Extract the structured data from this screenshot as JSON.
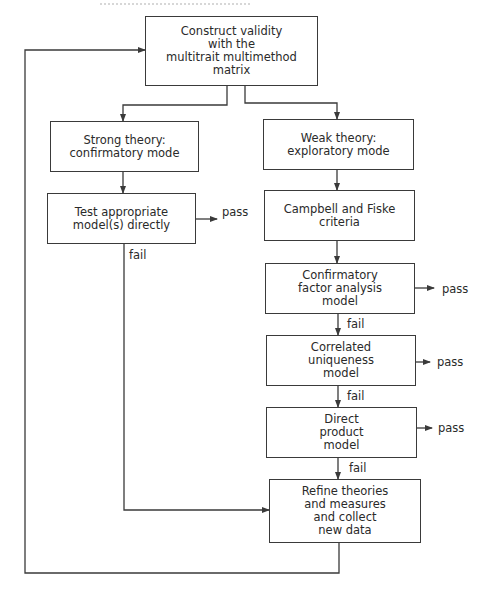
{
  "header": {
    "cutoff_text_visible": false
  },
  "colors": {
    "line": "#3a3a3a",
    "text": "#2a2a2a",
    "background": "#ffffff"
  },
  "nodes": [
    {
      "id": "construct",
      "x": 145,
      "y": 16,
      "w": 173,
      "h": 70,
      "lines": [
        "Construct validity",
        "with the",
        "multitrait multimethod",
        "matrix"
      ]
    },
    {
      "id": "strong",
      "x": 50,
      "y": 121,
      "w": 149,
      "h": 51,
      "lines": [
        "Strong theory:",
        "confirmatory mode"
      ]
    },
    {
      "id": "test",
      "x": 47,
      "y": 193,
      "w": 149,
      "h": 51,
      "lines": [
        "Test appropriate",
        "model(s) directly"
      ]
    },
    {
      "id": "weak",
      "x": 263,
      "y": 119,
      "w": 151,
      "h": 51,
      "lines": [
        "Weak theory:",
        "exploratory mode"
      ]
    },
    {
      "id": "campbell",
      "x": 264,
      "y": 190,
      "w": 151,
      "h": 51,
      "lines": [
        "Campbell and Fiske",
        "criteria"
      ]
    },
    {
      "id": "cfa",
      "x": 265,
      "y": 263,
      "w": 150,
      "h": 51,
      "lines": [
        "Confirmatory",
        "factor analysis",
        "model"
      ]
    },
    {
      "id": "correlated",
      "x": 266,
      "y": 335,
      "w": 150,
      "h": 51,
      "lines": [
        "Correlated",
        "uniqueness",
        "model"
      ]
    },
    {
      "id": "direct",
      "x": 266,
      "y": 407,
      "w": 151,
      "h": 51,
      "lines": [
        "Direct",
        "product",
        "model"
      ]
    },
    {
      "id": "refine",
      "x": 269,
      "y": 479,
      "w": 152,
      "h": 64,
      "lines": [
        "Refine theories",
        "and measures",
        "and collect",
        "new data"
      ]
    }
  ],
  "labels": [
    {
      "id": "pass-test",
      "text": "pass",
      "x": 222,
      "y": 206
    },
    {
      "id": "fail-test",
      "text": "fail",
      "x": 129,
      "y": 249
    },
    {
      "id": "pass-cfa",
      "text": "pass",
      "x": 442,
      "y": 283
    },
    {
      "id": "fail-cfa",
      "text": "fail",
      "x": 347,
      "y": 318
    },
    {
      "id": "pass-correlated",
      "text": "pass",
      "x": 437,
      "y": 356
    },
    {
      "id": "fail-correlated",
      "text": "fail",
      "x": 347,
      "y": 390
    },
    {
      "id": "pass-direct",
      "text": "pass",
      "x": 438,
      "y": 422
    },
    {
      "id": "fail-direct",
      "text": "fail",
      "x": 349,
      "y": 462
    }
  ],
  "edges": [
    {
      "id": "construct-to-strong",
      "points": [
        [
          227,
          86
        ],
        [
          227,
          105
        ],
        [
          123,
          105
        ],
        [
          123,
          121
        ]
      ],
      "arrow": true
    },
    {
      "id": "construct-to-weak",
      "points": [
        [
          245,
          86
        ],
        [
          245,
          103
        ],
        [
          337,
          103
        ],
        [
          337,
          119
        ]
      ],
      "arrow": true
    },
    {
      "id": "strong-to-test",
      "points": [
        [
          123,
          172
        ],
        [
          123,
          193
        ]
      ],
      "arrow": true
    },
    {
      "id": "test-pass",
      "points": [
        [
          196,
          219
        ],
        [
          217,
          219
        ]
      ],
      "arrow": true
    },
    {
      "id": "test-fail-to-refine",
      "points": [
        [
          124,
          244
        ],
        [
          124,
          510
        ],
        [
          269,
          510
        ]
      ],
      "arrow": true
    },
    {
      "id": "weak-to-campbell",
      "points": [
        [
          337,
          170
        ],
        [
          337,
          190
        ]
      ],
      "arrow": true
    },
    {
      "id": "campbell-to-cfa",
      "points": [
        [
          337,
          241
        ],
        [
          337,
          263
        ]
      ],
      "arrow": true
    },
    {
      "id": "cfa-pass",
      "points": [
        [
          415,
          288
        ],
        [
          434,
          288
        ]
      ],
      "arrow": true
    },
    {
      "id": "cfa-to-correlated",
      "points": [
        [
          338,
          314
        ],
        [
          338,
          335
        ]
      ],
      "arrow": true
    },
    {
      "id": "correlated-pass",
      "points": [
        [
          416,
          362
        ],
        [
          430,
          362
        ]
      ],
      "arrow": true
    },
    {
      "id": "correlated-to-direct",
      "points": [
        [
          338,
          386
        ],
        [
          338,
          407
        ]
      ],
      "arrow": true
    },
    {
      "id": "direct-pass",
      "points": [
        [
          417,
          428
        ],
        [
          432,
          428
        ]
      ],
      "arrow": true
    },
    {
      "id": "direct-to-refine",
      "points": [
        [
          338,
          458
        ],
        [
          338,
          479
        ]
      ],
      "arrow": true
    },
    {
      "id": "refine-loop-back",
      "points": [
        [
          339,
          543
        ],
        [
          339,
          573
        ],
        [
          25,
          573
        ],
        [
          25,
          50
        ],
        [
          145,
          50
        ]
      ],
      "arrow": true
    }
  ]
}
